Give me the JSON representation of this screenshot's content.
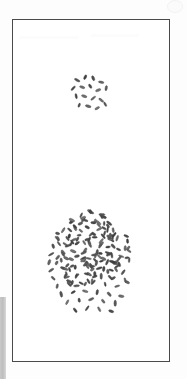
{
  "figure": {
    "title": "",
    "caption": "",
    "background_color": "#fdfdfd",
    "plate": {
      "frame_color": "#4a4a4a",
      "fill_color": "#ffffff",
      "border_width_px": 1.4,
      "left_px": 12,
      "top_px": 19,
      "width_px": 158,
      "height_px": 343
    },
    "artifacts": {
      "margin_bar": {
        "name": "scan-margin-bar",
        "color": "#c4c4c4",
        "left_px": 0,
        "top_px": 297,
        "width_px": 6,
        "height_px": 82
      },
      "corner_mark": {
        "name": "corner-artifact",
        "color": "#f2f2f2",
        "left_px": 167,
        "top_px": 0,
        "diameter_px": 13
      }
    }
  },
  "chart_data": {
    "type": "scatter",
    "title": "",
    "subtitle": "",
    "xlabel": "",
    "ylabel": "",
    "xlim": [
      0,
      158
    ],
    "ylim": [
      0,
      343
    ],
    "grid": false,
    "legend": null,
    "annotations": [],
    "marker": {
      "shape": "ellipse",
      "semantic": "grain-particle",
      "length_px": 5.2,
      "width_px": 2.1,
      "fill_color": "#5e5e5e",
      "edge_color": "#3c3c3c"
    },
    "series": [
      {
        "name": "small-cluster",
        "count": 17,
        "centroid": [
          78,
          74
        ],
        "spread_radius_px": 18,
        "points": [
          [
            64,
            60,
            38
          ],
          [
            72,
            57,
            112
          ],
          [
            80,
            58,
            75
          ],
          [
            88,
            62,
            20
          ],
          [
            60,
            68,
            140
          ],
          [
            69,
            67,
            8
          ],
          [
            77,
            66,
            55
          ],
          [
            85,
            70,
            160
          ],
          [
            93,
            68,
            95
          ],
          [
            63,
            76,
            70
          ],
          [
            71,
            76,
            25
          ],
          [
            80,
            78,
            130
          ],
          [
            88,
            80,
            45
          ],
          [
            66,
            85,
            100
          ],
          [
            75,
            86,
            15
          ],
          [
            84,
            88,
            150
          ],
          [
            92,
            84,
            62
          ]
        ]
      },
      {
        "name": "large-cluster",
        "count": 176,
        "centroid": [
          78,
          230
        ],
        "spread_radius_px": 40,
        "points": [
          [
            78,
            192,
            30
          ],
          [
            68,
            195,
            110
          ],
          [
            88,
            196,
            70
          ],
          [
            58,
            202,
            150
          ],
          [
            72,
            200,
            15
          ],
          [
            82,
            201,
            95
          ],
          [
            96,
            203,
            45
          ],
          [
            50,
            210,
            130
          ],
          [
            62,
            208,
            60
          ],
          [
            74,
            207,
            20
          ],
          [
            86,
            209,
            165
          ],
          [
            100,
            210,
            80
          ],
          [
            44,
            218,
            40
          ],
          [
            56,
            216,
            120
          ],
          [
            66,
            215,
            5
          ],
          [
            78,
            214,
            140
          ],
          [
            90,
            216,
            55
          ],
          [
            104,
            218,
            100
          ],
          [
            40,
            226,
            75
          ],
          [
            52,
            224,
            25
          ],
          [
            64,
            223,
            155
          ],
          [
            76,
            222,
            65
          ],
          [
            88,
            224,
            135
          ],
          [
            100,
            226,
            35
          ],
          [
            112,
            228,
            90
          ],
          [
            38,
            234,
            145
          ],
          [
            50,
            232,
            50
          ],
          [
            60,
            231,
            10
          ],
          [
            72,
            230,
            125
          ],
          [
            84,
            232,
            85
          ],
          [
            96,
            234,
            160
          ],
          [
            108,
            236,
            30
          ],
          [
            36,
            242,
            105
          ],
          [
            48,
            240,
            70
          ],
          [
            58,
            239,
            20
          ],
          [
            70,
            238,
            150
          ],
          [
            82,
            240,
            40
          ],
          [
            94,
            242,
            115
          ],
          [
            106,
            244,
            60
          ],
          [
            116,
            240,
            85
          ],
          [
            38,
            250,
            135
          ],
          [
            50,
            248,
            25
          ],
          [
            62,
            247,
            95
          ],
          [
            74,
            246,
            55
          ],
          [
            86,
            248,
            165
          ],
          [
            98,
            250,
            15
          ],
          [
            110,
            252,
            120
          ],
          [
            40,
            258,
            45
          ],
          [
            52,
            256,
            100
          ],
          [
            64,
            255,
            140
          ],
          [
            76,
            254,
            30
          ],
          [
            88,
            256,
            80
          ],
          [
            100,
            258,
            160
          ],
          [
            112,
            260,
            65
          ],
          [
            44,
            266,
            110
          ],
          [
            56,
            264,
            50
          ],
          [
            68,
            263,
            20
          ],
          [
            80,
            262,
            130
          ],
          [
            92,
            264,
            90
          ],
          [
            104,
            266,
            155
          ],
          [
            114,
            262,
            35
          ],
          [
            48,
            274,
            75
          ],
          [
            60,
            272,
            145
          ],
          [
            72,
            271,
            25
          ],
          [
            84,
            272,
            105
          ],
          [
            96,
            274,
            60
          ],
          [
            108,
            276,
            15
          ],
          [
            54,
            282,
            120
          ],
          [
            66,
            280,
            85
          ],
          [
            78,
            279,
            150
          ],
          [
            90,
            281,
            40
          ],
          [
            102,
            283,
            95
          ],
          [
            62,
            290,
            55
          ],
          [
            74,
            288,
            125
          ],
          [
            86,
            289,
            70
          ],
          [
            98,
            291,
            20
          ]
        ]
      }
    ]
  }
}
